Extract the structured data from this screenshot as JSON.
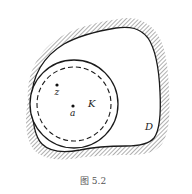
{
  "figure": {
    "caption": "图 5.2",
    "labels": {
      "z": "z",
      "a": "a",
      "K": "K",
      "D": "D"
    },
    "colors": {
      "stroke": "#1a1a1a",
      "hatch": "#6b6b6b",
      "background": "#ffffff"
    }
  }
}
